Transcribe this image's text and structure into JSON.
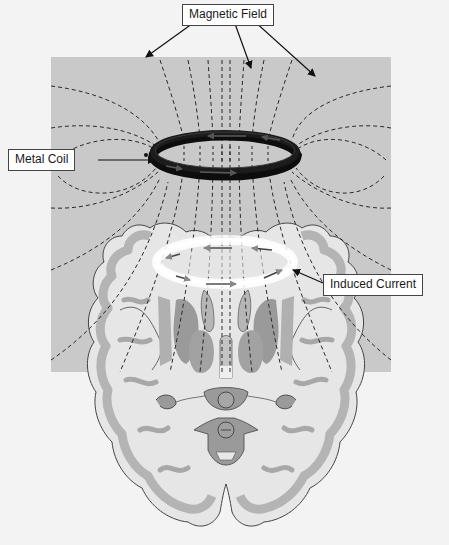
{
  "figure": {
    "labels": {
      "magnetic_field": "Magnetic Field",
      "metal_coil": "Metal Coil",
      "induced_current": "Induced Current"
    },
    "colors": {
      "background": "#f3f3f3",
      "field_panel": "#c9c9c9",
      "field_lines": "#2a2a2a",
      "coil": "#111111",
      "induced_ring": "#ffffff",
      "brain_white_matter": "#e6e6e6",
      "brain_gray_matter": "#b9b9b9",
      "brain_deep_nuclei": "#9a9a9a"
    },
    "field_panel": {
      "x": 51,
      "y": 57,
      "width": 340,
      "height": 315
    },
    "coil": {
      "cx": 225,
      "cy": 152,
      "rx": 72,
      "ry": 20,
      "current_direction": "counterclockwise-arrows"
    },
    "induced_current_ring": {
      "cx": 225,
      "cy": 258,
      "rx": 66,
      "ry": 20
    },
    "pointer_dots": [
      {
        "x": 146,
        "y": 155
      },
      {
        "x": 300,
        "y": 155
      }
    ]
  }
}
